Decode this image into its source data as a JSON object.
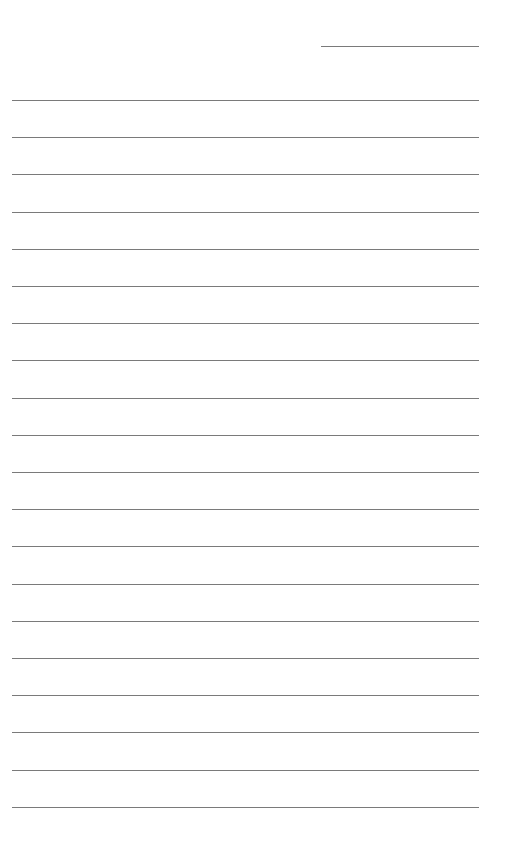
{
  "page": {
    "type": "blank-lined-paper",
    "background_color": "#ffffff",
    "line_color": "#7a7a7a",
    "header_line": {
      "left": 321,
      "top": 46,
      "width": 158
    },
    "ruled_lines": {
      "count": 20,
      "left": 12,
      "width": 467,
      "first_top": 100,
      "spacing": 37.2
    }
  }
}
